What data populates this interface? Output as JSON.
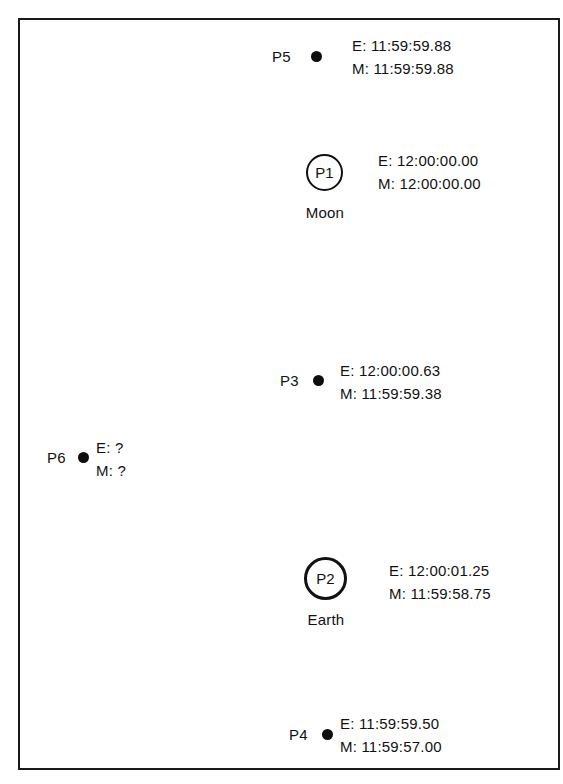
{
  "figure": {
    "background_color": "#ffffff",
    "frame_color": "#1a1a1a",
    "marker_color": "#0d0d0d",
    "text_color": "#111111",
    "nodes": [
      {
        "id": "P5",
        "marker": "filled-dot",
        "body_name": "",
        "earth_clock": "E: 11:59:59.88",
        "moon_clock": "M: 11:59:59.88"
      },
      {
        "id": "P1",
        "marker": "open-circle",
        "body_name": "Moon",
        "earth_clock": "E: 12:00:00.00",
        "moon_clock": "M: 12:00:00.00"
      },
      {
        "id": "P3",
        "marker": "filled-dot",
        "body_name": "",
        "earth_clock": "E: 12:00:00.63",
        "moon_clock": "M: 11:59:59.38"
      },
      {
        "id": "P6",
        "marker": "filled-dot",
        "body_name": "",
        "earth_clock": "E: ?",
        "moon_clock": "M: ?"
      },
      {
        "id": "P2",
        "marker": "open-circle-thick",
        "body_name": "Earth",
        "earth_clock": "E: 12:00:01.25",
        "moon_clock": "M: 11:59:58.75"
      },
      {
        "id": "P4",
        "marker": "filled-dot",
        "body_name": "",
        "earth_clock": "E: 11:59:59.50",
        "moon_clock": "M: 11:59:57.00"
      }
    ]
  }
}
